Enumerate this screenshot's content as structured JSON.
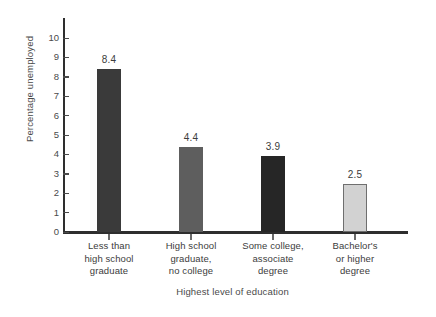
{
  "chart_data": {
    "type": "bar",
    "title": "",
    "xlabel": "Highest level of education",
    "ylabel": "Percentage unemployed",
    "categories": [
      "Less than\nhigh school\ngraduate",
      "High school\ngraduate,\nno college",
      "Some college,\nassociate\ndegree",
      "Bachelor's\nor higher\ndegree"
    ],
    "category_lines": [
      [
        "Less than",
        "high school",
        "graduate"
      ],
      [
        "High school",
        "graduate,",
        "no college"
      ],
      [
        "Some college,",
        "associate",
        "degree"
      ],
      [
        "Bachelor's",
        "or higher",
        "degree"
      ]
    ],
    "values": [
      8.4,
      4.4,
      3.9,
      2.5
    ],
    "value_labels": [
      "8.4",
      "4.4",
      "3.9",
      "2.5"
    ],
    "bar_colors": [
      "#3a3a3a",
      "#5e5e5e",
      "#262626",
      "#d2d2d2"
    ],
    "bar_border_colors": [
      "#3a3a3a",
      "#5e5e5e",
      "#262626",
      "#6f6f6f"
    ],
    "ylim": [
      0,
      10
    ],
    "yticks": [
      0,
      1,
      2,
      3,
      4,
      5,
      6,
      7,
      8,
      9,
      10
    ],
    "ytick_labels": [
      "0",
      "1",
      "2",
      "3",
      "4",
      "5",
      "6",
      "7",
      "8",
      "9",
      "10"
    ],
    "grid": false,
    "legend": null,
    "axis_color": "#2e2e2e",
    "text_color": "#3c3c3c",
    "background": "#ffffff"
  }
}
